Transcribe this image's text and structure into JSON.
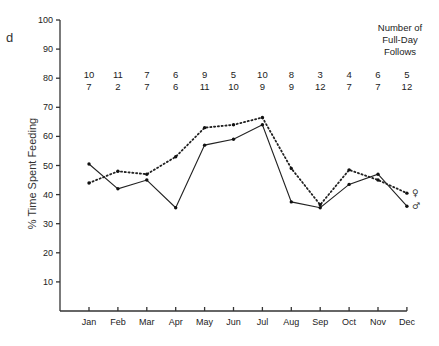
{
  "chart_data": {
    "type": "line",
    "title": "",
    "xlabel": "",
    "ylabel": "% Time Spent Feeding",
    "ylim": [
      0,
      100
    ],
    "yticks": [
      10,
      20,
      30,
      40,
      50,
      60,
      70,
      80,
      90,
      100
    ],
    "grid": false,
    "categories": [
      "Jan",
      "Feb",
      "Mar",
      "Apr",
      "May",
      "Jun",
      "Jul",
      "Aug",
      "Sep",
      "Oct",
      "Nov",
      "Dec"
    ],
    "series": [
      {
        "name": "♀",
        "label": "female",
        "style": "dotted",
        "values": [
          44,
          48,
          47,
          53,
          63,
          64,
          66.5,
          49,
          36.5,
          48.5,
          45,
          40.5
        ]
      },
      {
        "name": "♂",
        "label": "male",
        "style": "solid",
        "values": [
          50.5,
          42,
          45,
          35.5,
          57,
          59,
          64,
          37.5,
          35.5,
          43.5,
          47,
          36
        ]
      }
    ],
    "annotations": {
      "counts_header": [
        "Number of",
        "Full-Day",
        "Follows"
      ],
      "counts_top": [
        10,
        11,
        7,
        6,
        9,
        5,
        10,
        8,
        3,
        4,
        6,
        5
      ],
      "counts_bottom": [
        7,
        2,
        7,
        6,
        11,
        10,
        9,
        9,
        12,
        7,
        7,
        12
      ]
    },
    "legend_position": "inline-right-end"
  },
  "page": {
    "clipped_glyph": "d"
  }
}
